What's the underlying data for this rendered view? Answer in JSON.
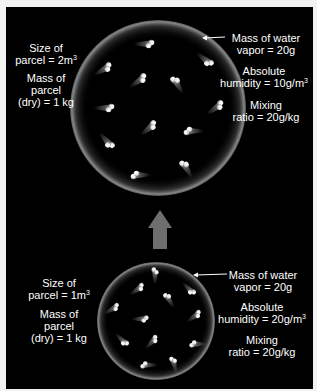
{
  "diagram": {
    "title": "",
    "colors": {
      "background": "#000000",
      "page": "#f2f2f2",
      "text": "#ffffff",
      "arrow": "#6e6e6e",
      "molecule": "#ffffff"
    },
    "expanded_parcel": {
      "size_label_line1": "Size of",
      "size_label_line2": "parcel = 2m",
      "size_label_sup": "3",
      "mass_label_line1": "Mass of",
      "mass_label_line2": "parcel",
      "mass_label_line3": "(dry) = 1 kg",
      "vapor_label_line1": "Mass of water",
      "vapor_label_line2": "vapor = 20g",
      "humidity_label_line1": "Absolute",
      "humidity_label_line2": "humidity = 10g/m",
      "humidity_label_sup": "3",
      "mixing_label_line1": "Mixing",
      "mixing_label_line2": "ratio = 20g/kg",
      "molecule_count": 12
    },
    "compressed_parcel": {
      "size_label_line1": "Size of",
      "size_label_line2": "parcel = 1m",
      "size_label_sup": "3",
      "mass_label_line1": "Mass of",
      "mass_label_line2": "parcel",
      "mass_label_line3": "(dry) = 1 kg",
      "vapor_label_line1": "Mass of water",
      "vapor_label_line2": "vapor = 20g",
      "humidity_label_line1": "Absolute",
      "humidity_label_line2": "humidity = 20g/m",
      "humidity_label_sup": "3",
      "mixing_label_line1": "Mixing",
      "mixing_label_line2": "ratio = 20g/kg",
      "molecule_count": 12
    },
    "transition_arrow": "up-arrow"
  }
}
